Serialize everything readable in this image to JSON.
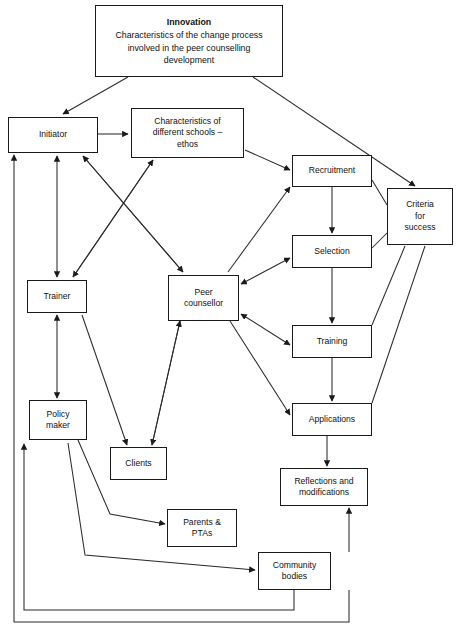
{
  "diagram": {
    "title": "Characteristics of the change process involved in the peer counselling development",
    "type": "flowchart",
    "stroke_color": "#1a1a1a",
    "background_color": "#ffffff",
    "nodes": [
      {
        "id": "innovation",
        "heading": "Innovation",
        "body": "Characteristics of the change process\ninvolved in the peer counselling\ndevelopment",
        "x": 95,
        "y": 5,
        "w": 188,
        "h": 72
      },
      {
        "id": "initiator",
        "label": "Initiator",
        "x": 8,
        "y": 117,
        "w": 90,
        "h": 36
      },
      {
        "id": "characteristics",
        "label": "Characteristics of\ndifferent schools –\nethos",
        "x": 131,
        "y": 108,
        "w": 113,
        "h": 50
      },
      {
        "id": "recruitment",
        "label": "Recruitment",
        "x": 292,
        "y": 155,
        "w": 80,
        "h": 32
      },
      {
        "id": "criteria",
        "label": "Criteria\nfor\nsuccess",
        "x": 387,
        "y": 188,
        "w": 66,
        "h": 57
      },
      {
        "id": "selection",
        "label": "Selection",
        "x": 292,
        "y": 235,
        "w": 80,
        "h": 33
      },
      {
        "id": "trainer",
        "label": "Trainer",
        "x": 27,
        "y": 280,
        "w": 60,
        "h": 33
      },
      {
        "id": "peer_counsellor",
        "label": "Peer\ncounsellor",
        "x": 168,
        "y": 275,
        "w": 71,
        "h": 46
      },
      {
        "id": "training",
        "label": "Training",
        "x": 292,
        "y": 325,
        "w": 80,
        "h": 33
      },
      {
        "id": "policy_maker",
        "label": "Policy\nmaker",
        "x": 29,
        "y": 400,
        "w": 58,
        "h": 40
      },
      {
        "id": "applications",
        "label": "Applications",
        "x": 292,
        "y": 403,
        "w": 80,
        "h": 33
      },
      {
        "id": "clients",
        "label": "Clients",
        "x": 110,
        "y": 447,
        "w": 57,
        "h": 33
      },
      {
        "id": "reflections",
        "label": "Reflections and\nmodifications",
        "x": 280,
        "y": 468,
        "w": 88,
        "h": 38
      },
      {
        "id": "parents",
        "label": "Parents &\nPTAs",
        "x": 167,
        "y": 509,
        "w": 70,
        "h": 38
      },
      {
        "id": "community",
        "label": "Community\nbodies",
        "x": 258,
        "y": 552,
        "w": 73,
        "h": 38
      }
    ],
    "edges": [
      {
        "from": "innovation",
        "to": "initiator",
        "kind": "arrow"
      },
      {
        "from": "innovation",
        "to": "criteria",
        "kind": "arrow"
      },
      {
        "from": "initiator",
        "to": "characteristics",
        "kind": "arrow"
      },
      {
        "from": "initiator",
        "to": "peer_counsellor",
        "kind": "arrow"
      },
      {
        "from": "characteristics",
        "to": "trainer",
        "kind": "arrow"
      },
      {
        "from": "trainer",
        "to": "characteristics",
        "kind": "arrow"
      },
      {
        "from": "peer_counsellor",
        "to": "initiator",
        "kind": "arrow"
      },
      {
        "from": "characteristics",
        "to": "recruitment",
        "kind": "arrow"
      },
      {
        "from": "peer_counsellor",
        "to": "recruitment",
        "kind": "arrow"
      },
      {
        "from": "recruitment",
        "to": "criteria",
        "kind": "line"
      },
      {
        "from": "recruitment",
        "to": "selection",
        "kind": "arrow"
      },
      {
        "from": "selection",
        "to": "criteria",
        "kind": "line"
      },
      {
        "from": "selection",
        "to": "peer_counsellor",
        "kind": "arrow-both"
      },
      {
        "from": "selection",
        "to": "training",
        "kind": "arrow"
      },
      {
        "from": "training",
        "to": "peer_counsellor",
        "kind": "arrow-both"
      },
      {
        "from": "training",
        "to": "criteria",
        "kind": "line"
      },
      {
        "from": "training",
        "to": "applications",
        "kind": "arrow"
      },
      {
        "from": "applications",
        "to": "criteria",
        "kind": "line"
      },
      {
        "from": "peer_counsellor",
        "to": "applications",
        "kind": "arrow"
      },
      {
        "from": "applications",
        "to": "reflections",
        "kind": "arrow"
      },
      {
        "from": "initiator",
        "to": "trainer",
        "kind": "arrow-both"
      },
      {
        "from": "trainer",
        "to": "policy_maker",
        "kind": "arrow-both"
      },
      {
        "from": "trainer",
        "to": "clients",
        "kind": "arrow"
      },
      {
        "from": "peer_counsellor",
        "to": "clients",
        "kind": "arrow"
      },
      {
        "from": "clients",
        "to": "peer_counsellor",
        "kind": "arrow"
      },
      {
        "from": "policy_maker",
        "to": "parents",
        "kind": "arrow"
      },
      {
        "from": "policy_maker",
        "to": "community",
        "kind": "arrow"
      },
      {
        "from": "community",
        "to": "reflections",
        "kind": "arrow"
      },
      {
        "from": "reflections",
        "to": "initiator",
        "kind": "feedback"
      },
      {
        "from": "reflections",
        "to": "community",
        "kind": "feedback"
      }
    ]
  }
}
